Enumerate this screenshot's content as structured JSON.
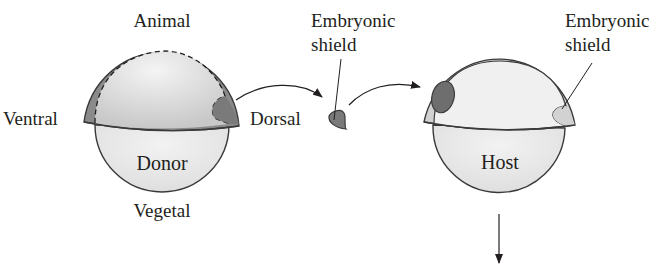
{
  "donor": {
    "label": "Donor",
    "poles": {
      "top": "Animal",
      "bottom": "Vegetal",
      "left": "Ventral",
      "right": "Dorsal"
    }
  },
  "excised_tissue": {
    "label_line1": "Embryonic",
    "label_line2": "shield"
  },
  "host": {
    "label": "Host",
    "shield_label_line1": "Embryonic",
    "shield_label_line2": "shield"
  },
  "colors": {
    "dark_tissue": "#7a7a7a",
    "cap_light": "#d9d9d9",
    "yolk": "#e6e6e6",
    "host_cap": "#d4d4d4",
    "outline": "#3a3a3a"
  }
}
